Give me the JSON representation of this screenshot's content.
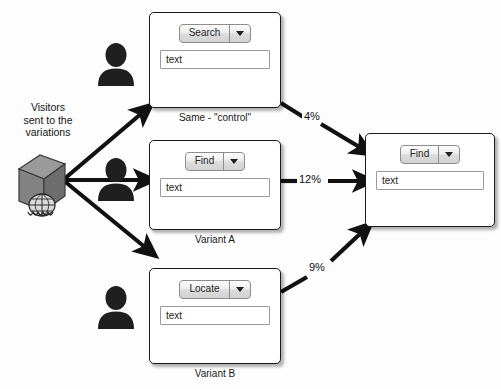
{
  "diagram": {
    "background_color": "#fdfdfd",
    "source": {
      "icon": "server-icon",
      "caption_lines": [
        "Visitors",
        "sent to the",
        "variations"
      ],
      "caption_text": "Visitors sent to the variations"
    },
    "variations": [
      {
        "id": "control",
        "caption": "Same - \"control\"",
        "dropdown_label": "Search",
        "input_value": "text",
        "conversion_rate": "4%",
        "avatar_name": "visitor-avatar-control"
      },
      {
        "id": "variant-a",
        "caption": "Variant A",
        "dropdown_label": "Find",
        "input_value": "text",
        "conversion_rate": "12%",
        "avatar_name": "visitor-avatar-variant-a"
      },
      {
        "id": "variant-b",
        "caption": "Variant B",
        "dropdown_label": "Locate",
        "input_value": "text",
        "conversion_rate": "9%",
        "avatar_name": "visitor-avatar-variant-b"
      }
    ],
    "destination": {
      "id": "goal-page",
      "dropdown_label": "Find",
      "input_value": "text",
      "caption": ""
    },
    "colors": {
      "line": "#111111",
      "box_border": "#1b1b1b",
      "box_fill": "#ffffff",
      "control_fill": "#d8d8d8",
      "text": "#141414",
      "silhouette": "#1f1f1f"
    }
  }
}
